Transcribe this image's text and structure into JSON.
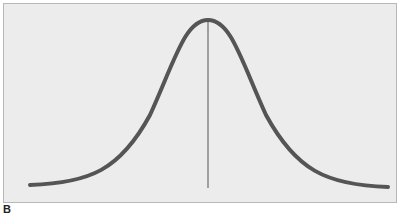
{
  "figure": {
    "panel_label": "B",
    "curve_color": "#555555",
    "mean_line_color": "#555555",
    "background_color": "#ececec"
  }
}
